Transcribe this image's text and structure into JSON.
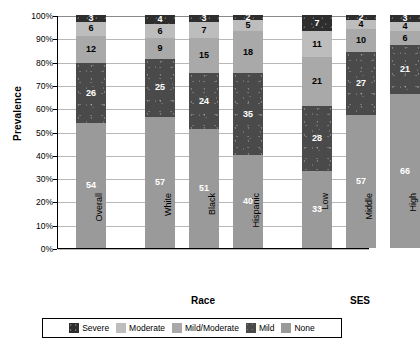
{
  "chart_data": {
    "type": "bar",
    "subtype": "stacked-bar-100",
    "title": "",
    "xlabel": "",
    "ylabel": "Prevalence",
    "ylim": [
      0,
      100
    ],
    "ytick_labels": [
      "100%",
      "90%",
      "80%",
      "70%",
      "60%",
      "50%",
      "40%",
      "30%",
      "20%",
      "10%",
      "0%"
    ],
    "ytick_values": [
      100,
      90,
      80,
      70,
      60,
      50,
      40,
      30,
      20,
      10,
      0
    ],
    "grid": true,
    "legend_position": "bottom",
    "categories": [
      "Overall",
      "White",
      "Black",
      "Hispanic",
      "Low",
      "Middle",
      "High"
    ],
    "groups": [
      {
        "label": "Race",
        "categories": [
          "White",
          "Black",
          "Hispanic"
        ]
      },
      {
        "label": "SES",
        "categories": [
          "Low",
          "Middle",
          "High"
        ]
      }
    ],
    "series": [
      {
        "name": "None",
        "key": "none",
        "color": "#9a9a9a",
        "values": [
          54,
          57,
          51,
          40,
          33,
          57,
          66
        ]
      },
      {
        "name": "Mild",
        "key": "mild",
        "color": "#4a4a4a",
        "values": [
          26,
          25,
          24,
          35,
          28,
          27,
          21
        ]
      },
      {
        "name": "Mild/Moderate",
        "key": "mildmod",
        "color": "#a9a9a9",
        "values": [
          12,
          9,
          15,
          18,
          21,
          10,
          6
        ]
      },
      {
        "name": "Moderate",
        "key": "moderate",
        "color": "#bdbdbd",
        "values": [
          6,
          6,
          7,
          5,
          11,
          4,
          4
        ]
      },
      {
        "name": "Severe",
        "key": "severe",
        "color": "#2e2e2e",
        "values": [
          3,
          4,
          3,
          2,
          7,
          2,
          3
        ]
      }
    ],
    "legend_entries": [
      {
        "label": "Severe",
        "key": "severe",
        "color": "#2e2e2e"
      },
      {
        "label": "Moderate",
        "key": "moderate",
        "color": "#bdbdbd"
      },
      {
        "label": "Mild/Moderate",
        "key": "mildmod",
        "color": "#a9a9a9"
      },
      {
        "label": "Mild",
        "key": "mild",
        "color": "#4a4a4a"
      },
      {
        "label": "None",
        "key": "none",
        "color": "#9a9a9a"
      }
    ]
  }
}
